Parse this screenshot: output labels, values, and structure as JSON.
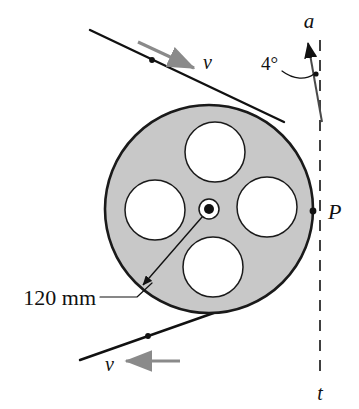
{
  "figure": {
    "background_color": "#ffffff",
    "ink_color": "#111111",
    "wheel_fill_color": "#c8c8c8",
    "hole_fill_color": "#ffffff",
    "velocity_arrow_color": "#8a8a8a",
    "width": 359,
    "height": 409
  },
  "labels": {
    "acceleration": "a",
    "angle": "4°",
    "point_p": "P",
    "tangent_line": "t",
    "velocity_top": "v",
    "velocity_bottom": "v",
    "radius_dimension": "120 mm"
  },
  "geometry": {
    "wheel": {
      "cx": 209,
      "cy": 209,
      "r": 104
    },
    "hub": {
      "cx": 209,
      "cy": 209,
      "r_outer": 10,
      "r_inner": 5
    },
    "holes": [
      {
        "name": "hole-top",
        "cx": 215,
        "cy": 152,
        "r": 30
      },
      {
        "name": "hole-left",
        "cx": 155,
        "cy": 210,
        "r": 30
      },
      {
        "name": "hole-right",
        "cx": 267,
        "cy": 207,
        "r": 30
      },
      {
        "name": "hole-bottom",
        "cx": 213,
        "cy": 267,
        "r": 30
      }
    ],
    "point_p": {
      "x": 313,
      "y": 211
    },
    "dashed_line": {
      "x": 320,
      "y_top": 40,
      "y_bottom": 376
    },
    "acceleration_arrow": {
      "x_tail": 322,
      "y_tail": 122,
      "x_tip": 308,
      "y_tip": 43
    },
    "belt_top": {
      "x1": 90,
      "y1": 30,
      "x2": 284,
      "y2": 122
    },
    "belt_bottom": {
      "x1": 80,
      "y1": 360,
      "x2": 262,
      "y2": 296
    },
    "radius_arrow": {
      "x_tail": 209,
      "y_tail": 209,
      "x_tip": 143,
      "y_tip": 285
    }
  },
  "annotations": {
    "angle_value_degrees": 4,
    "radius_value_mm": 120
  }
}
